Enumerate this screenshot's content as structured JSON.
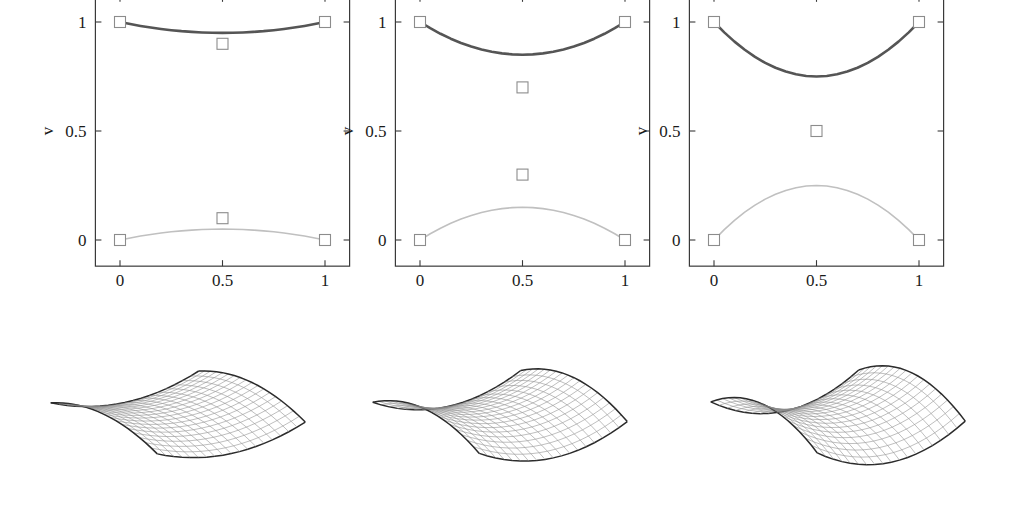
{
  "figure": {
    "background": "#ffffff",
    "panel_count": 3
  },
  "chart_data": [
    {
      "type": "line",
      "panel_index": 1,
      "title": "",
      "xlabel": "u",
      "ylabel": "v",
      "xlim": [
        -0.12,
        1.12
      ],
      "ylim": [
        -0.12,
        1.12
      ],
      "xticks": [
        0,
        0.5,
        1
      ],
      "xticklabels": [
        "0",
        "0.5",
        "1"
      ],
      "yticks": [
        0,
        0.5,
        1
      ],
      "yticklabels": [
        "0",
        "0.5",
        "1"
      ],
      "grid": false,
      "legend": "none",
      "series": [
        {
          "name": "upper-curve",
          "color": "#555555",
          "linewidth": 2.6,
          "x": [
            0.0,
            0.05,
            0.1,
            0.15,
            0.2,
            0.25,
            0.3,
            0.35,
            0.4,
            0.45,
            0.5,
            0.55,
            0.6,
            0.65,
            0.7,
            0.75,
            0.8,
            0.85,
            0.9,
            0.95,
            1.0
          ],
          "values": [
            1.0,
            0.9905,
            0.982,
            0.9745,
            0.968,
            0.9625,
            0.958,
            0.9545,
            0.952,
            0.9505,
            0.95,
            0.9505,
            0.952,
            0.9545,
            0.958,
            0.9625,
            0.968,
            0.9745,
            0.982,
            0.9905,
            1.0
          ]
        },
        {
          "name": "lower-curve",
          "color": "#c0c0c0",
          "linewidth": 1.6,
          "x": [
            0.0,
            0.05,
            0.1,
            0.15,
            0.2,
            0.25,
            0.3,
            0.35,
            0.4,
            0.45,
            0.5,
            0.55,
            0.6,
            0.65,
            0.7,
            0.75,
            0.8,
            0.85,
            0.9,
            0.95,
            1.0
          ],
          "values": [
            0.0,
            0.0095,
            0.018,
            0.0255,
            0.032,
            0.0375,
            0.042,
            0.0455,
            0.048,
            0.0495,
            0.05,
            0.0495,
            0.048,
            0.0455,
            0.042,
            0.0375,
            0.032,
            0.0255,
            0.018,
            0.0095,
            0.0
          ]
        }
      ],
      "control_points": [
        {
          "u": 0.0,
          "v": 1.0
        },
        {
          "u": 1.0,
          "v": 1.0
        },
        {
          "u": 0.5,
          "v": 0.9
        },
        {
          "u": 0.5,
          "v": 0.1
        },
        {
          "u": 0.0,
          "v": 0.0
        },
        {
          "u": 1.0,
          "v": 0.0
        }
      ]
    },
    {
      "type": "line",
      "panel_index": 2,
      "title": "",
      "xlabel": "u",
      "ylabel": "v",
      "xlim": [
        -0.12,
        1.12
      ],
      "ylim": [
        -0.12,
        1.12
      ],
      "xticks": [
        0,
        0.5,
        1
      ],
      "xticklabels": [
        "0",
        "0.5",
        "1"
      ],
      "yticks": [
        0,
        0.5,
        1
      ],
      "yticklabels": [
        "0",
        "0.5",
        "1"
      ],
      "grid": false,
      "legend": "none",
      "series": [
        {
          "name": "upper-curve",
          "color": "#555555",
          "linewidth": 2.6,
          "x": [
            0.0,
            0.05,
            0.1,
            0.15,
            0.2,
            0.25,
            0.3,
            0.35,
            0.4,
            0.45,
            0.5,
            0.55,
            0.6,
            0.65,
            0.7,
            0.75,
            0.8,
            0.85,
            0.9,
            0.95,
            1.0
          ],
          "values": [
            1.0,
            0.9715,
            0.946,
            0.9235,
            0.904,
            0.8875,
            0.874,
            0.8635,
            0.856,
            0.8515,
            0.85,
            0.8515,
            0.856,
            0.8635,
            0.874,
            0.8875,
            0.904,
            0.9235,
            0.946,
            0.9715,
            1.0
          ]
        },
        {
          "name": "lower-curve",
          "color": "#c0c0c0",
          "linewidth": 1.6,
          "x": [
            0.0,
            0.05,
            0.1,
            0.15,
            0.2,
            0.25,
            0.3,
            0.35,
            0.4,
            0.45,
            0.5,
            0.55,
            0.6,
            0.65,
            0.7,
            0.75,
            0.8,
            0.85,
            0.9,
            0.95,
            1.0
          ],
          "values": [
            0.0,
            0.0285,
            0.054,
            0.0765,
            0.096,
            0.1125,
            0.126,
            0.1365,
            0.144,
            0.1485,
            0.15,
            0.1485,
            0.144,
            0.1365,
            0.126,
            0.1125,
            0.096,
            0.0765,
            0.054,
            0.0285,
            0.0
          ]
        }
      ],
      "control_points": [
        {
          "u": 0.0,
          "v": 1.0
        },
        {
          "u": 1.0,
          "v": 1.0
        },
        {
          "u": 0.5,
          "v": 0.7
        },
        {
          "u": 0.5,
          "v": 0.3
        },
        {
          "u": 0.0,
          "v": 0.0
        },
        {
          "u": 1.0,
          "v": 0.0
        }
      ]
    },
    {
      "type": "line",
      "panel_index": 3,
      "title": "",
      "xlabel": "u",
      "ylabel": "v",
      "xlim": [
        -0.12,
        1.12
      ],
      "ylim": [
        -0.12,
        1.12
      ],
      "xticks": [
        0,
        0.5,
        1
      ],
      "xticklabels": [
        "0",
        "0.5",
        "1"
      ],
      "yticks": [
        0,
        0.5,
        1
      ],
      "yticklabels": [
        "0",
        "0.5",
        "1"
      ],
      "grid": false,
      "legend": "none",
      "series": [
        {
          "name": "upper-curve",
          "color": "#555555",
          "linewidth": 2.6,
          "x": [
            0.0,
            0.05,
            0.1,
            0.15,
            0.2,
            0.25,
            0.3,
            0.35,
            0.4,
            0.45,
            0.5,
            0.55,
            0.6,
            0.65,
            0.7,
            0.75,
            0.8,
            0.85,
            0.9,
            0.95,
            1.0
          ],
          "values": [
            1.0,
            0.9525,
            0.91,
            0.8725,
            0.84,
            0.8125,
            0.79,
            0.7725,
            0.76,
            0.7525,
            0.75,
            0.7525,
            0.76,
            0.7725,
            0.79,
            0.8125,
            0.84,
            0.8725,
            0.91,
            0.9525,
            1.0
          ]
        },
        {
          "name": "lower-curve",
          "color": "#c0c0c0",
          "linewidth": 1.6,
          "x": [
            0.0,
            0.05,
            0.1,
            0.15,
            0.2,
            0.25,
            0.3,
            0.35,
            0.4,
            0.45,
            0.5,
            0.55,
            0.6,
            0.65,
            0.7,
            0.75,
            0.8,
            0.85,
            0.9,
            0.95,
            1.0
          ],
          "values": [
            0.0,
            0.0475,
            0.09,
            0.1275,
            0.16,
            0.1875,
            0.21,
            0.2275,
            0.24,
            0.2475,
            0.25,
            0.2475,
            0.24,
            0.2275,
            0.21,
            0.1875,
            0.16,
            0.1275,
            0.09,
            0.0475,
            0.0
          ]
        }
      ],
      "control_points": [
        {
          "u": 0.0,
          "v": 1.0
        },
        {
          "u": 1.0,
          "v": 1.0
        },
        {
          "u": 0.5,
          "v": 0.5
        },
        {
          "u": 0.0,
          "v": 0.0
        },
        {
          "u": 1.0,
          "v": 0.0
        }
      ]
    }
  ],
  "surfaces": [
    {
      "name": "surface-1",
      "index": 1,
      "description": "wireframe saddle surface, mild curvature",
      "mesh_u": 18,
      "mesh_v": 18,
      "line_color": "#8a8a8a",
      "edge_color": "#2b2b2b",
      "twist": 0.1
    },
    {
      "name": "surface-2",
      "index": 2,
      "description": "wireframe saddle surface, moderate curvature",
      "mesh_u": 18,
      "mesh_v": 18,
      "line_color": "#8a8a8a",
      "edge_color": "#2b2b2b",
      "twist": 0.3
    },
    {
      "name": "surface-3",
      "index": 3,
      "description": "wireframe saddle surface, strong curvature",
      "mesh_u": 18,
      "mesh_v": 18,
      "line_color": "#8a8a8a",
      "edge_color": "#2b2b2b",
      "twist": 0.5
    }
  ],
  "style": {
    "axis_color": "#3a3a3a",
    "text_color": "#1a1a1a",
    "marker_edge": "#8c8c8c",
    "marker_size": 11
  }
}
